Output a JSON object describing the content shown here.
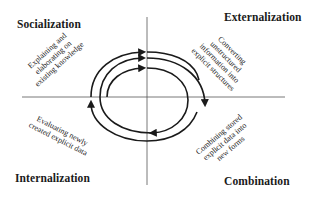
{
  "quadrants": {
    "top_left": {
      "title": "Socialization",
      "description_lines": [
        "Explaining and",
        "elaborating on",
        "existing knowledge"
      ]
    },
    "top_right": {
      "title": "Externalization",
      "description_lines": [
        "Converting",
        "unstructured",
        "information into",
        "explicit structures"
      ]
    },
    "bottom_left": {
      "title": "Internalization",
      "description_lines": [
        "Evaluating newly",
        "created explicit data"
      ]
    },
    "bottom_right": {
      "title": "Combination",
      "description_lines": [
        "Combining stored",
        "explicit data into",
        "new forms"
      ]
    }
  },
  "colors": {
    "line": "#1a1a1a",
    "axis": "#555555",
    "background": "#ffffff"
  }
}
